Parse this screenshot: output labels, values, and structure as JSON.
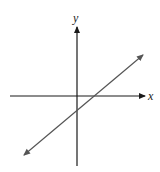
{
  "diagram": {
    "type": "coordinate-plane-with-line",
    "axes": {
      "x_label": "x",
      "y_label": "y",
      "color": "#1a1a1a"
    },
    "line": {
      "description": "Straight line with positive slope, double-headed arrow, crossing positive x-axis and negative y-axis",
      "color": "#555555",
      "slope_sign": "positive",
      "x_intercept_sign": "positive",
      "y_intercept_sign": "negative"
    }
  }
}
